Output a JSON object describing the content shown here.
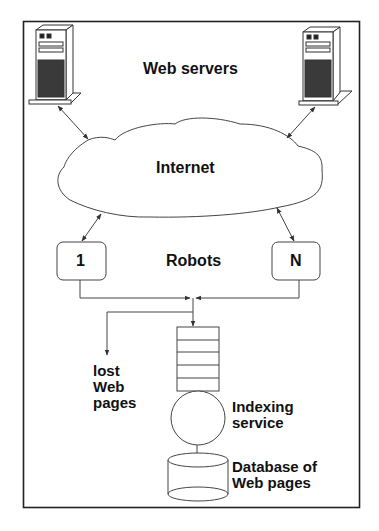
{
  "diagram": {
    "labels": {
      "web_servers": "Web servers",
      "internet": "Internet",
      "robots": "Robots",
      "robot_first": "1",
      "robot_last": "N",
      "lost_pages_line1": "lost",
      "lost_pages_line2": "Web",
      "lost_pages_line3": "pages",
      "indexing_line1": "Indexing",
      "indexing_line2": "service",
      "database_line1": "Database of",
      "database_line2": "Web pages"
    },
    "nodes": [
      {
        "id": "server-left",
        "type": "server"
      },
      {
        "id": "server-right",
        "type": "server"
      },
      {
        "id": "internet",
        "type": "cloud"
      },
      {
        "id": "robot-1",
        "type": "box"
      },
      {
        "id": "robot-n",
        "type": "box"
      },
      {
        "id": "queue",
        "type": "queue",
        "slots": 5
      },
      {
        "id": "indexing-service",
        "type": "circle"
      },
      {
        "id": "database",
        "type": "cylinder"
      }
    ],
    "edges": [
      {
        "from": "server-left",
        "to": "internet",
        "bidirectional": true
      },
      {
        "from": "server-right",
        "to": "internet",
        "bidirectional": true
      },
      {
        "from": "internet",
        "to": "robot-1",
        "bidirectional": true
      },
      {
        "from": "internet",
        "to": "robot-n",
        "bidirectional": true
      },
      {
        "from": "robot-1",
        "to": "queue"
      },
      {
        "from": "robot-n",
        "to": "queue"
      },
      {
        "from": "queue",
        "to": "lost-web-pages"
      },
      {
        "from": "queue",
        "to": "indexing-service"
      },
      {
        "from": "indexing-service",
        "to": "database"
      }
    ],
    "colors": {
      "stroke": "#333333",
      "server_dark": "#3a3a3a",
      "frame": "#222222"
    }
  }
}
